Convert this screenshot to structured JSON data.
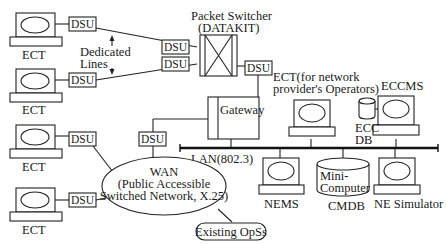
{
  "diagram": {
    "packet_switcher": {
      "title": "Packet Switcher",
      "subtitle": "(DATAKIT)"
    },
    "dedicated_lines": {
      "line1": "Dedicated",
      "line2": "Lines"
    },
    "dsu_label": "DSU",
    "ect_label": "ECT",
    "gateway": "Gateway",
    "operator_ect": {
      "line1": "ECT(for network",
      "line2": "provider's Operators)"
    },
    "eccms": "ECCMS",
    "ecc_db": {
      "line1": "ECC",
      "line2": "DB"
    },
    "lan": "LAN(802.3)",
    "wan": {
      "line1": "WAN",
      "line2": "(Public Accessible",
      "line3": "Switched Network, X.25)"
    },
    "existing_opss": "Existing OpSs",
    "nems": "NEMS",
    "minicomputer": {
      "line1": "Mini-",
      "line2": "Computer"
    },
    "cmdb": "CMDB",
    "ne_simulator": "NE Simulator"
  }
}
